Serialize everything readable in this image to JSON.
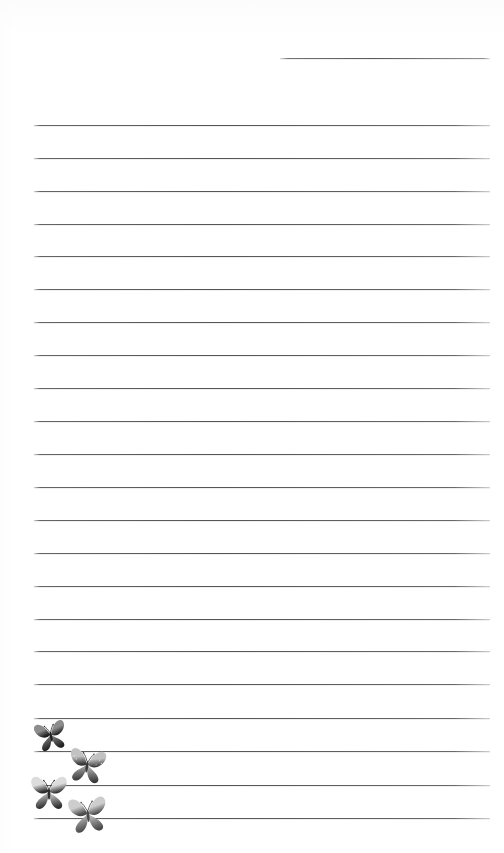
{
  "page": {
    "kind": "lined-writing-paper",
    "width": 504,
    "height": 853,
    "background_color": "#ffffff",
    "rule_color": "#585858",
    "rule_left_margin": 34,
    "rule_right_margin": 14,
    "rule_spacing": 33,
    "total_rules": 23,
    "title": "",
    "body_text": ""
  },
  "rules": [
    {
      "id": "rule-header-partial",
      "y": 58,
      "x": 280,
      "width": 210,
      "partial": true
    },
    {
      "id": "rule-1",
      "y": 125,
      "x": 34,
      "width": 456,
      "partial": false
    },
    {
      "id": "rule-2",
      "y": 158,
      "x": 34,
      "width": 456,
      "partial": false
    },
    {
      "id": "rule-3",
      "y": 191,
      "x": 34,
      "width": 456,
      "partial": false
    },
    {
      "id": "rule-4",
      "y": 224,
      "x": 34,
      "width": 456,
      "partial": false
    },
    {
      "id": "rule-5",
      "y": 256,
      "x": 34,
      "width": 456,
      "partial": false
    },
    {
      "id": "rule-6",
      "y": 289,
      "x": 34,
      "width": 456,
      "partial": false
    },
    {
      "id": "rule-7",
      "y": 322,
      "x": 34,
      "width": 456,
      "partial": false
    },
    {
      "id": "rule-8",
      "y": 355,
      "x": 34,
      "width": 456,
      "partial": false
    },
    {
      "id": "rule-9",
      "y": 388,
      "x": 34,
      "width": 456,
      "partial": false
    },
    {
      "id": "rule-10",
      "y": 421,
      "x": 34,
      "width": 456,
      "partial": false
    },
    {
      "id": "rule-11",
      "y": 454,
      "x": 34,
      "width": 456,
      "partial": false
    },
    {
      "id": "rule-12",
      "y": 487,
      "x": 34,
      "width": 456,
      "partial": false
    },
    {
      "id": "rule-13",
      "y": 520,
      "x": 34,
      "width": 456,
      "partial": false
    },
    {
      "id": "rule-14",
      "y": 553,
      "x": 34,
      "width": 456,
      "partial": false
    },
    {
      "id": "rule-15",
      "y": 586,
      "x": 34,
      "width": 456,
      "partial": false
    },
    {
      "id": "rule-16",
      "y": 619,
      "x": 34,
      "width": 456,
      "partial": false
    },
    {
      "id": "rule-17",
      "y": 651,
      "x": 34,
      "width": 456,
      "partial": false
    },
    {
      "id": "rule-18",
      "y": 684,
      "x": 34,
      "width": 456,
      "partial": false
    },
    {
      "id": "rule-19",
      "y": 718,
      "x": 34,
      "width": 456,
      "partial": false
    },
    {
      "id": "rule-20",
      "y": 751,
      "x": 34,
      "width": 456,
      "partial": false
    },
    {
      "id": "rule-21",
      "y": 785,
      "x": 34,
      "width": 456,
      "partial": false
    },
    {
      "id": "rule-22",
      "y": 818,
      "x": 34,
      "width": 456,
      "partial": false
    }
  ],
  "decorations": {
    "label": "butterflies",
    "count": 4,
    "butterflies": [
      {
        "id": "butterfly-1",
        "x": 33,
        "y": 714,
        "width": 36,
        "height": 44,
        "rotation": -12,
        "tone_light": "#8d8d8d",
        "tone_dark": "#1f1f1f",
        "spotted": false
      },
      {
        "id": "butterfly-2",
        "x": 66,
        "y": 743,
        "width": 42,
        "height": 46,
        "rotation": 8,
        "tone_light": "#c2c2c2",
        "tone_dark": "#3a3a3a",
        "spotted": true
      },
      {
        "id": "butterfly-3",
        "x": 28,
        "y": 772,
        "width": 42,
        "height": 42,
        "rotation": 0,
        "tone_light": "#dcdcdc",
        "tone_dark": "#2e2e2e",
        "spotted": false
      },
      {
        "id": "butterfly-4",
        "x": 66,
        "y": 793,
        "width": 44,
        "height": 44,
        "rotation": -6,
        "tone_light": "#cdcdcd",
        "tone_dark": "#4a4a4a",
        "spotted": false
      }
    ]
  }
}
